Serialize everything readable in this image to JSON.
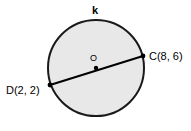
{
  "figure": {
    "kind": "circle-with-diameter",
    "background_color": "#ffffff",
    "circle": {
      "name": "k",
      "label": "k",
      "center_label": "O",
      "fill_color": "#e8e8e8",
      "stroke_color": "#1a1a1a",
      "stroke_width": 2,
      "center_x": 96,
      "center_y": 68,
      "radius": 49
    },
    "center_point": {
      "label": "O",
      "x": 96,
      "y": 68,
      "dot_color": "#000000",
      "dot_radius": 2
    },
    "diameter": {
      "stroke_color": "#000000",
      "stroke_width": 2,
      "endpoints": [
        {
          "label": "D(2, 2)",
          "point_name": "D",
          "coord_x": 2,
          "coord_y": 2,
          "px_x": 50,
          "px_y": 85,
          "dot_color": "#000000",
          "dot_radius": 2
        },
        {
          "label": "C(8, 6)",
          "point_name": "C",
          "coord_x": 8,
          "coord_y": 6,
          "px_x": 143,
          "px_y": 56,
          "dot_color": "#000000",
          "dot_radius": 2
        }
      ]
    },
    "labels": {
      "circle_name": "k",
      "center": "O",
      "point_c": "C(8, 6)",
      "point_d": "D(2, 2)"
    }
  }
}
